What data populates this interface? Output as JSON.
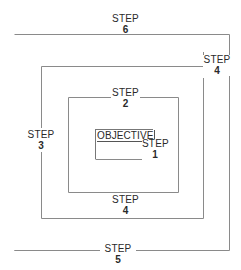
{
  "diagram": {
    "type": "concentric-squares",
    "line_color": "#8a8a8a",
    "center": {
      "label": "OBJECTIVE"
    },
    "steps": [
      {
        "word": "STEP",
        "number": "1",
        "position": "objective-box bottom-right"
      },
      {
        "word": "STEP",
        "number": "2",
        "position": "third-box top edge"
      },
      {
        "word": "STEP",
        "number": "3",
        "position": "second-box left edge"
      },
      {
        "word": "STEP",
        "number": "4",
        "position": "second-box top-right corner"
      },
      {
        "word": "STEP",
        "number": "4",
        "position": "between third and second box bottom"
      },
      {
        "word": "STEP",
        "number": "5",
        "position": "outer-box bottom edge"
      },
      {
        "word": "STEP",
        "number": "6",
        "position": "above outer-box top edge"
      }
    ]
  }
}
